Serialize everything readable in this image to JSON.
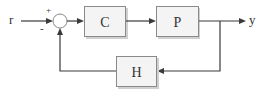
{
  "diagram": {
    "type": "feedback-control-loop",
    "input_label": "r",
    "output_label": "y",
    "summing_junction": {
      "plus_sign": "+",
      "minus_sign": "-"
    },
    "blocks": [
      {
        "id": "controller",
        "label": "C"
      },
      {
        "id": "plant",
        "label": "P"
      },
      {
        "id": "feedback",
        "label": "H"
      }
    ],
    "colors": {
      "line": "#3a3a3a",
      "block_fill": "#f4f4f4",
      "block_border": "#8a8a8a"
    }
  }
}
